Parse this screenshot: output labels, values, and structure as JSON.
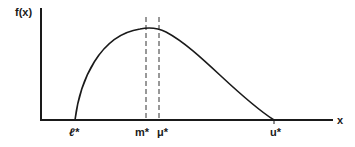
{
  "diagram": {
    "y_axis_label": "f(x)",
    "x_axis_label": "x",
    "ticks": [
      {
        "label": "ℓ*",
        "x": 75
      },
      {
        "label": "m*",
        "x": 146
      },
      {
        "label": "μ*",
        "x": 159
      },
      {
        "label": "u*",
        "x": 274
      }
    ],
    "curve": "right-skewed unimodal density from ℓ* to u*, mode at m*, mean at μ*",
    "colors": {
      "line": "#1a1a1a",
      "background": "#ffffff"
    }
  }
}
